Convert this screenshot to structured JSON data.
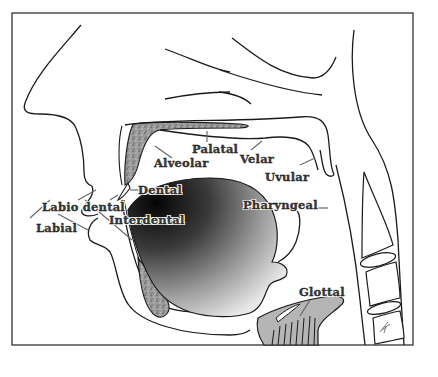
{
  "diagram": {
    "colors": {
      "outline": "#1a1a1a",
      "frame": "#333333",
      "bone_fill": "#8a8a8a",
      "tongue_dark": "#0a0a0a",
      "tongue_light": "#e6e6e6",
      "larynx_fill": "#b5b5b5",
      "pointer": "#7a7a7a"
    },
    "labels": {
      "palatal": "Palatal",
      "alveolar": "Alveolar",
      "velar": "Velar",
      "uvular": "Uvular",
      "dental": "Dental",
      "labiodental": "Labio dental",
      "interdental": "Interdental",
      "labial": "Labial",
      "pharyngeal": "Pharyngeal",
      "glottal": "Glottal"
    }
  }
}
